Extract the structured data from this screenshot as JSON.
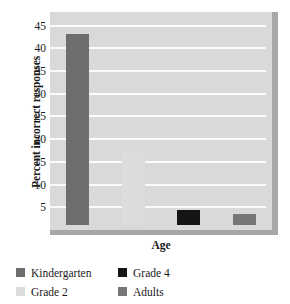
{
  "chart_data": {
    "type": "bar",
    "title": "",
    "xlabel": "Age",
    "ylabel": "Percent incorrect responses",
    "categories": [
      "Kindergarten",
      "Grade 2",
      "Grade 4",
      "Adults"
    ],
    "values": [
      42,
      16,
      3.3,
      2.5
    ],
    "ylim": [
      0,
      48
    ],
    "yticks": [
      5,
      10,
      15,
      20,
      25,
      30,
      35,
      40,
      45
    ],
    "ytick_labels": [
      "5",
      "10",
      "15",
      "20",
      "25",
      "30",
      "35",
      "40",
      "45"
    ],
    "xtick_labels": [],
    "grid": "horizontal",
    "legend_position": "below-plot",
    "series": [
      {
        "name": "Kindergarten",
        "value": 42,
        "color": "#6e6e6e"
      },
      {
        "name": "Grade 2",
        "value": 16,
        "color": "#dcdcdc"
      },
      {
        "name": "Grade 4",
        "value": 3.3,
        "color": "#151515"
      },
      {
        "name": "Adults",
        "value": 2.5,
        "color": "#767676"
      }
    ]
  },
  "axes": {
    "y_title": "Percent incorrect responses",
    "x_title": "Age"
  },
  "legend": {
    "items": [
      {
        "label": "Kindergarten",
        "color": "#6e6e6e"
      },
      {
        "label": "Grade 4",
        "color": "#151515"
      },
      {
        "label": "Grade 2",
        "color": "#dcdcdc"
      },
      {
        "label": "Adults",
        "color": "#767676"
      }
    ]
  },
  "colors": {
    "plot_background": "#d9d9d9",
    "gridline": "#fbfbfb",
    "plot_shadow": "#a7a7a7",
    "page_background": "#ffffff",
    "text": "#1a1a1a"
  }
}
